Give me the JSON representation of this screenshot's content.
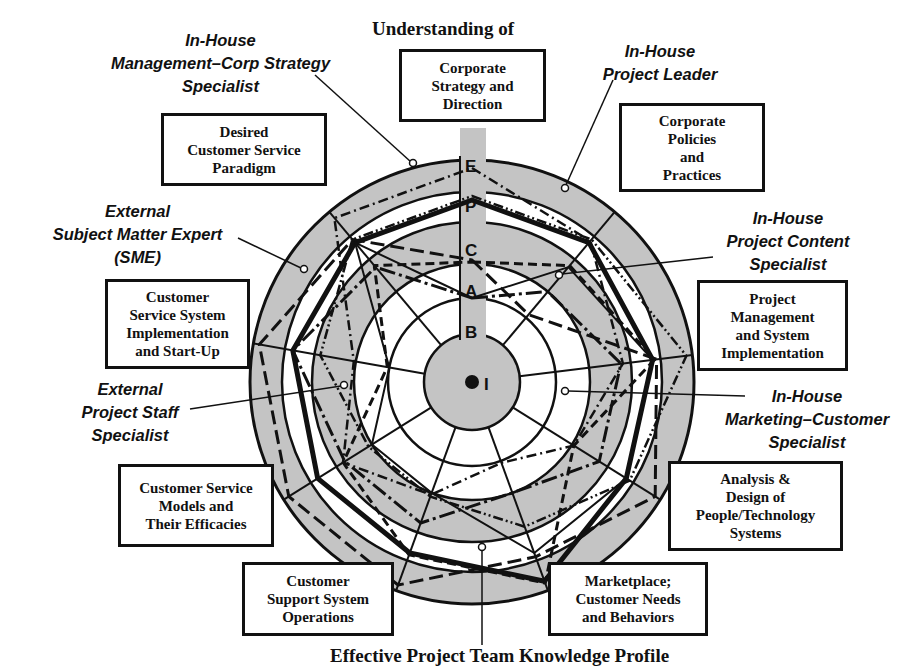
{
  "title": "Understanding of",
  "caption": "Effective Project Team Knowledge Profile",
  "colors": {
    "band_gray": "#c4c4c4",
    "line": "#111111",
    "background": "#ffffff"
  },
  "scale": {
    "levels": [
      "I",
      "B",
      "A",
      "C",
      "P",
      "E"
    ],
    "note": "Concentric rings from center (I) outward to E"
  },
  "categories": [
    {
      "id": "corp-strategy",
      "label": "Corporate\nStrategy and\nDirection"
    },
    {
      "id": "corp-policies",
      "label": "Corporate\nPolicies\nand\nPractices"
    },
    {
      "id": "pm-system-impl",
      "label": "Project\nManagement\nand System\nImplementation"
    },
    {
      "id": "analysis-design",
      "label": "Analysis &\nDesign of\nPeople/Technology\nSystems"
    },
    {
      "id": "marketplace",
      "label": "Marketplace;\nCustomer Needs\nand Behaviors"
    },
    {
      "id": "support-ops",
      "label": "Customer\nSupport System\nOperations"
    },
    {
      "id": "service-models",
      "label": "Customer Service\nModels and\nTheir Efficacies"
    },
    {
      "id": "css-impl",
      "label": "Customer\nService System\nImplementation\nand Start-Up"
    },
    {
      "id": "desired-paradigm",
      "label": "Desired\nCustomer Service\nParadigm"
    }
  ],
  "roles": [
    {
      "id": "mgmt-corp-strategy",
      "label": "In-House\nManagement–Corp Strategy\nSpecialist"
    },
    {
      "id": "project-leader",
      "label": "In-House\nProject Leader"
    },
    {
      "id": "project-content",
      "label": "In-House\nProject Content\nSpecialist"
    },
    {
      "id": "marketing-customer",
      "label": "In-House\nMarketing–Customer\nSpecialist"
    },
    {
      "id": "sme",
      "label": "External\nSubject Matter Expert\n(SME)"
    },
    {
      "id": "project-staff",
      "label": "External\nProject Staff\nSpecialist"
    }
  ],
  "chart_data": {
    "type": "radar",
    "title": "Understanding of",
    "caption": "Effective Project Team Knowledge Profile",
    "axes": [
      "Corporate Strategy and Direction",
      "Corporate Policies and Practices",
      "Project Management and System Implementation",
      "Analysis & Design of People/Technology Systems",
      "Marketplace; Customer Needs and Behaviors",
      "Customer Support System Operations",
      "Customer Service Models and Their Efficacies",
      "Customer Service System Implementation and Start-Up",
      "Desired Customer Service Paradigm"
    ],
    "scale_levels": [
      "I",
      "B",
      "A",
      "C",
      "P",
      "E"
    ],
    "series": [
      {
        "name": "Effective Project Team (combined)",
        "style": "heavy solid",
        "values": [
          "P",
          "P",
          "P",
          "P",
          "E",
          "P",
          "P",
          "P",
          "P"
        ]
      },
      {
        "name": "In-House Management–Corp Strategy Specialist",
        "style": "dash-dot",
        "values": [
          "E",
          "P",
          "C",
          "A",
          "B",
          "A",
          "C",
          "A",
          "E"
        ]
      },
      {
        "name": "In-House Project Leader",
        "style": "dash-dot-dot",
        "values": [
          "P",
          "P",
          "E",
          "P",
          "C",
          "A",
          "A",
          "C",
          "P"
        ]
      },
      {
        "name": "In-House Project Content Specialist",
        "style": "solid thin",
        "values": [
          "B",
          "C",
          "P",
          "P",
          "P",
          "A",
          "A",
          "B",
          "P"
        ]
      },
      {
        "name": "In-House Marketing–Customer Specialist",
        "style": "dashed",
        "values": [
          "A",
          "C",
          "P",
          "A",
          "E",
          "P",
          "C",
          "B",
          "C"
        ]
      },
      {
        "name": "External Subject Matter Expert (SME)",
        "style": "dashed long",
        "values": [
          "A",
          "B",
          "P",
          "E",
          "P",
          "E",
          "E",
          "E",
          "P"
        ]
      },
      {
        "name": "External Project Staff Specialist",
        "style": "dash-dot long",
        "values": [
          "B",
          "A",
          "C",
          "C",
          "A",
          "C",
          "C",
          "P",
          "C"
        ]
      }
    ]
  }
}
